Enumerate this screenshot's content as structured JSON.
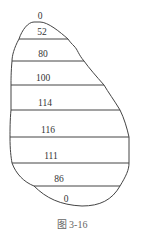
{
  "diagram": {
    "top_label": "0",
    "band_labels": [
      "52",
      "80",
      "100",
      "114",
      "116",
      "111",
      "86",
      "0"
    ],
    "caption": "图 3-16",
    "stroke_color": "#444444"
  }
}
